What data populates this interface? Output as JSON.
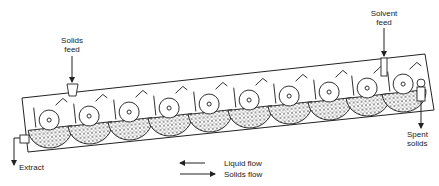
{
  "diagram": {
    "type": "continuous-extractor",
    "labels": {
      "solids_feed_line1": "Solids",
      "solids_feed_line2": "feed",
      "solvent_feed_line1": "Solvent",
      "solvent_feed_line2": "feed",
      "spent_solids_line1": "Spent",
      "spent_solids_line2": "solids",
      "extract": "Extract"
    },
    "legend": {
      "liquid_flow": "Liquid flow",
      "solids_flow": "Solids flow"
    },
    "wheel_count": 10,
    "colors": {
      "ink": "#222222",
      "background": "#ffffff"
    }
  }
}
